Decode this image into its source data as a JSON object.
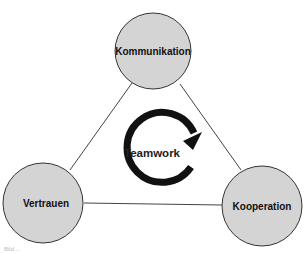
{
  "diagram": {
    "center_label": "Teamwork",
    "center_icon": "cycle-arrow-icon",
    "nodes": [
      {
        "id": "kommunikation",
        "label": "Kommunikation",
        "position": "top"
      },
      {
        "id": "vertrauen",
        "label": "Vertrauen",
        "position": "bottom-left"
      },
      {
        "id": "kooperation",
        "label": "Kooperation",
        "position": "bottom-right"
      }
    ],
    "edges": [
      {
        "from": "kommunikation",
        "to": "vertrauen"
      },
      {
        "from": "kommunikation",
        "to": "kooperation"
      },
      {
        "from": "vertrauen",
        "to": "kooperation"
      }
    ],
    "caption": "Bild ...",
    "colors": {
      "node_fill": "#d4d4d4",
      "node_stroke": "#333333",
      "arrow": "#111111",
      "edge": "#444444"
    }
  }
}
